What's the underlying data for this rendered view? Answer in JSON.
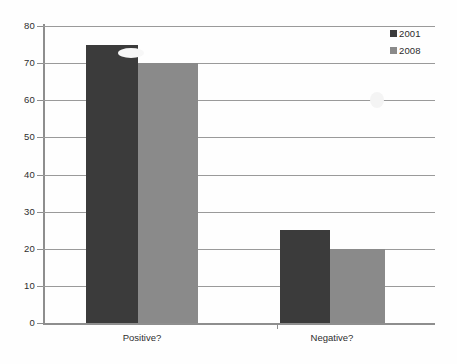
{
  "chart_data": {
    "type": "bar",
    "title": "",
    "subtitle": "",
    "xlabel": "",
    "ylabel": "",
    "categories": [
      "Positive?",
      "Negative?"
    ],
    "series": [
      {
        "name": "2001",
        "color": "#3b3b3b",
        "values": [
          75,
          25
        ]
      },
      {
        "name": "2008",
        "color": "#8a8a8a",
        "values": [
          70,
          20
        ]
      }
    ],
    "ylim": [
      0,
      80
    ],
    "ytick_labels": [
      "0",
      "10",
      "20",
      "30",
      "40",
      "50",
      "60",
      "70",
      "80"
    ],
    "ytick_values": [
      0,
      10,
      20,
      30,
      40,
      50,
      60,
      70,
      80
    ],
    "grid": true,
    "grid_axis": "y",
    "legend_position": "top-right",
    "legend_entries": [
      "2001",
      "2008"
    ],
    "annotations": []
  },
  "style": {
    "background": "#fefefe",
    "grid_color": "#9a9a9a",
    "axis_color": "#8e8e8e",
    "text_color": "#2e2e2e"
  }
}
